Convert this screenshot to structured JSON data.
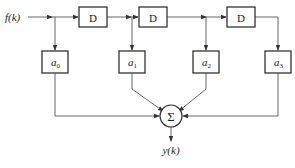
{
  "diagram": {
    "type": "FIR filter / tapped delay line block diagram",
    "input_label": "f(k)",
    "output_label": "y(k)",
    "delay_blocks": [
      {
        "label": "D"
      },
      {
        "label": "D"
      },
      {
        "label": "D"
      }
    ],
    "coefficient_blocks": [
      {
        "symbol": "a",
        "subscript": "0"
      },
      {
        "symbol": "a",
        "subscript": "1"
      },
      {
        "symbol": "a",
        "subscript": "2"
      },
      {
        "symbol": "a",
        "subscript": "3"
      }
    ],
    "summer": {
      "symbol": "Σ"
    },
    "colors": {
      "stroke": "#333333",
      "wire": "#555555",
      "background": "#ffffff"
    }
  }
}
